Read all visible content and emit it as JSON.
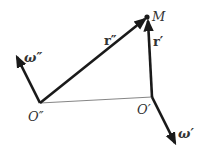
{
  "diagram": {
    "points": {
      "M": {
        "label": "M",
        "x": 147,
        "y": 17
      },
      "O_double": {
        "label": "O″",
        "x": 40,
        "y": 103
      },
      "O_single": {
        "label": "O′",
        "x": 152,
        "y": 97
      }
    },
    "vectors": {
      "r_double": {
        "label": "r″",
        "from": "O_double",
        "to": "M"
      },
      "r_single": {
        "label": "r′",
        "from": "O_single",
        "to": "M"
      },
      "omega_double": {
        "label": "ω″",
        "from": "O_double",
        "tip": [
          16,
          55
        ]
      },
      "omega_single": {
        "label": "ω′",
        "from": "O_single",
        "tip": [
          176,
          145
        ]
      }
    },
    "connector": {
      "from": "O_double",
      "to": "O_single"
    },
    "colors": {
      "stroke": "#1a1a1a",
      "thin": "#666666",
      "text": "#333333"
    }
  }
}
